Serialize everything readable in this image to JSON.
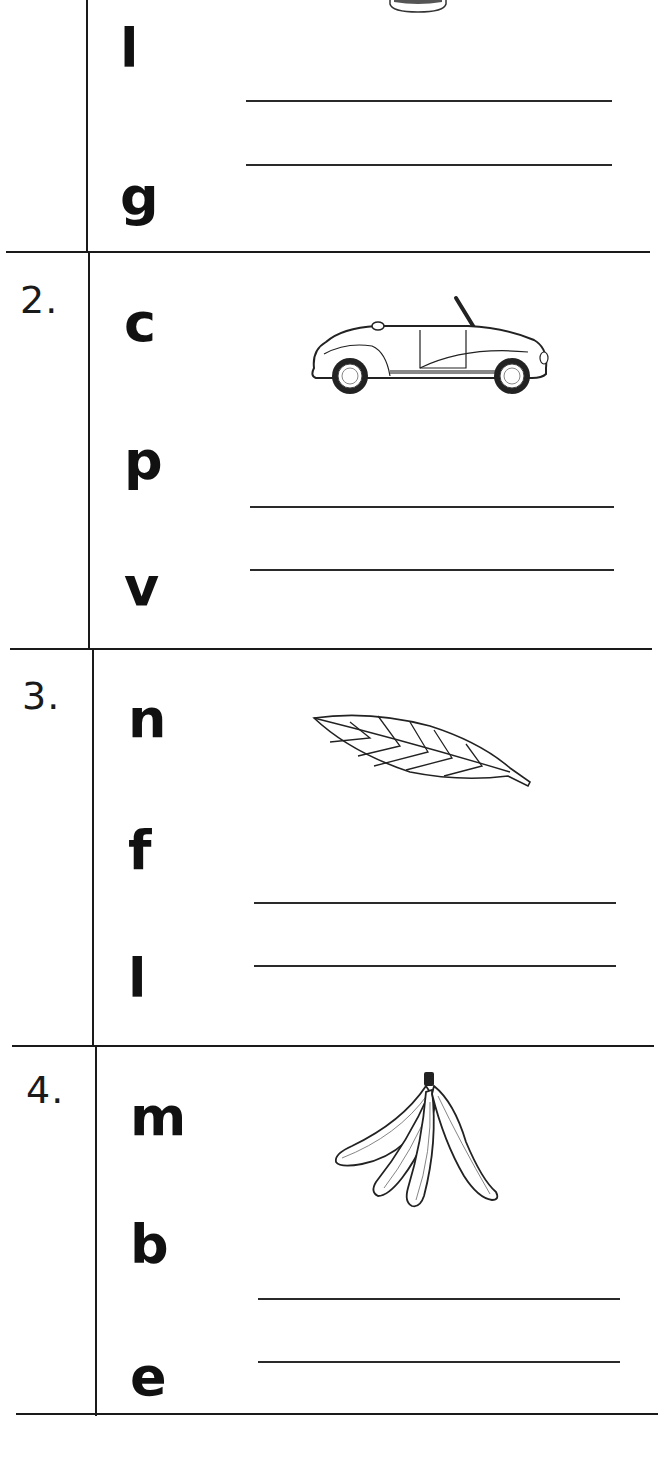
{
  "worksheet": {
    "rows": [
      {
        "number": "",
        "letters": [
          "l",
          "g"
        ],
        "picture": "partial-image-top",
        "answer_lines": 2
      },
      {
        "number": "2.",
        "letters": [
          "c",
          "p",
          "v"
        ],
        "picture": "car-icon",
        "answer_lines": 2
      },
      {
        "number": "3.",
        "letters": [
          "n",
          "f",
          "l"
        ],
        "picture": "leaf-icon",
        "answer_lines": 2
      },
      {
        "number": "4.",
        "letters": [
          "m",
          "b",
          "e"
        ],
        "picture": "banana-bunch-icon",
        "answer_lines": 2
      }
    ]
  }
}
